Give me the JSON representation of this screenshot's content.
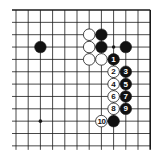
{
  "diagram": {
    "type": "go-board-corner",
    "corner": "top-right",
    "grid": {
      "columns": 12,
      "rows": 12,
      "origin_x": 16,
      "origin_y": 10,
      "spacing_x": 12.2,
      "spacing_y": 12.35,
      "edges": {
        "top": true,
        "right": true,
        "left": false,
        "bottom": false
      }
    },
    "colors": {
      "line": "#1a1a1a",
      "black_stone": "#111111",
      "white_stone": "#ffffff",
      "background": "#ffffff"
    },
    "star_points": [
      {
        "col": 2,
        "row": 9
      },
      {
        "col": 8,
        "row": 3
      }
    ],
    "stones": [
      {
        "color": "black",
        "col": 2,
        "row": 3,
        "label": ""
      },
      {
        "color": "white",
        "col": 6,
        "row": 2,
        "label": ""
      },
      {
        "color": "black",
        "col": 7,
        "row": 2,
        "label": ""
      },
      {
        "color": "white",
        "col": 6,
        "row": 3,
        "label": ""
      },
      {
        "color": "black",
        "col": 7,
        "row": 3,
        "label": ""
      },
      {
        "color": "black",
        "col": 9,
        "row": 3,
        "label": ""
      },
      {
        "color": "white",
        "col": 6,
        "row": 4,
        "label": ""
      },
      {
        "color": "white",
        "col": 7,
        "row": 4,
        "label": ""
      },
      {
        "color": "black",
        "col": 8,
        "row": 4,
        "label": "1"
      },
      {
        "color": "white",
        "col": 8,
        "row": 5,
        "label": "2"
      },
      {
        "color": "black",
        "col": 9,
        "row": 5,
        "label": "3"
      },
      {
        "color": "white",
        "col": 8,
        "row": 6,
        "label": "4"
      },
      {
        "color": "black",
        "col": 9,
        "row": 6,
        "label": "5"
      },
      {
        "color": "white",
        "col": 8,
        "row": 7,
        "label": "6"
      },
      {
        "color": "black",
        "col": 9,
        "row": 7,
        "label": "7"
      },
      {
        "color": "white",
        "col": 8,
        "row": 8,
        "label": "8"
      },
      {
        "color": "black",
        "col": 9,
        "row": 8,
        "label": "9"
      },
      {
        "color": "white",
        "col": 7,
        "row": 9,
        "label": "10"
      },
      {
        "color": "black",
        "col": 8,
        "row": 9,
        "label": ""
      }
    ]
  }
}
